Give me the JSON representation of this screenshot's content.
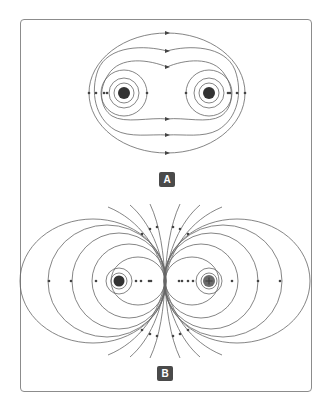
{
  "figure": {
    "top_caption_cutoff": "",
    "panels": [
      {
        "label": "A",
        "description": "Electric field lines of two like charges",
        "charges": [
          {
            "x": 124,
            "y": 93,
            "sign": "",
            "color": "#333333"
          },
          {
            "x": 209,
            "y": 93,
            "sign": "",
            "color": "#333333"
          }
        ]
      },
      {
        "label": "B",
        "description": "Magnetic/electric field lines of two opposite charges",
        "charges": [
          {
            "x": 119,
            "y": 281,
            "sign": "",
            "color": "#333333"
          },
          {
            "x": 209,
            "y": 281,
            "sign": "+",
            "color": "#6a6a6a"
          }
        ]
      }
    ],
    "colors": {
      "line": "#555555",
      "frame": "#8c8c8c",
      "badge_bg": "#4a4a4a",
      "badge_text": "#ffffff"
    }
  }
}
